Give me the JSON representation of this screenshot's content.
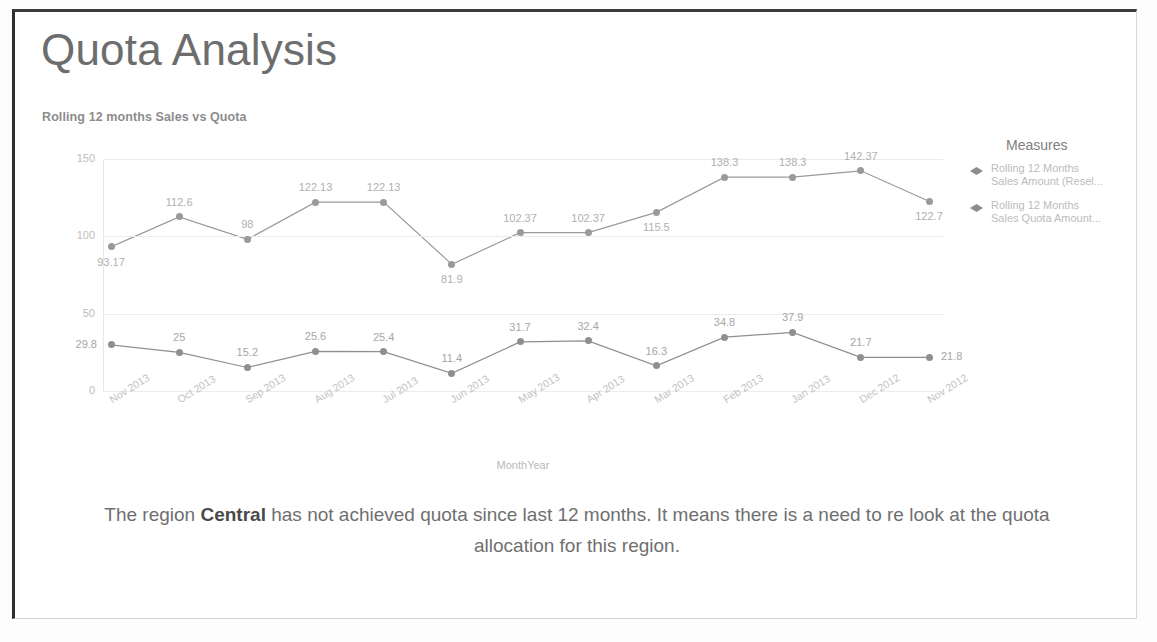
{
  "slide": {
    "title": "Quota Analysis",
    "caption_before": "The region ",
    "caption_bold": "Central",
    "caption_after": " has not achieved quota since last 12 months. It means there is a need to re look at the quota allocation for this region."
  },
  "legend": {
    "title": "Measures",
    "items": [
      {
        "label": "Rolling 12 Months\nSales Amount (Resel...",
        "marker": "diamond-marker-icon",
        "color": "#8d8d8d"
      },
      {
        "label": "Rolling 12 Months\nSales Quota Amount...",
        "marker": "diamond-marker-icon",
        "color": "#8d8d8d"
      }
    ]
  },
  "chart_data": {
    "type": "line",
    "title": "Rolling 12 months Sales vs Quota",
    "xlabel": "MonthYear",
    "ylabel": "",
    "ylim": [
      0,
      150
    ],
    "yticks": [
      "0",
      "50",
      "100",
      "150"
    ],
    "grid": true,
    "legend_position": "right",
    "categories": [
      "Nov 2013",
      "Oct 2013",
      "Sep 2013",
      "Aug 2013",
      "Jul 2013",
      "Jun 2013",
      "May 2013",
      "Apr 2013",
      "Mar 2013",
      "Feb 2013",
      "Jan 2013",
      "Dec 2012",
      "Nov 2012"
    ],
    "series": [
      {
        "name": "Rolling 12 Months Sales Amount (Resel...",
        "color": "#9a9a9a",
        "values": [
          93.17,
          112.6,
          98,
          122.13,
          122.13,
          81.9,
          102.37,
          102.37,
          115.5,
          138.3,
          138.3,
          142.37,
          122.7
        ],
        "labels": [
          "93.17",
          "112.6",
          "98",
          "122.13",
          "122.13",
          "81.9",
          "102.37",
          "102.37",
          "115.5",
          "138.3",
          "138.3",
          "142.37",
          "122.7"
        ],
        "label_positions": [
          "below",
          "above",
          "above",
          "above",
          "above",
          "below",
          "above",
          "above",
          "below",
          "above",
          "above",
          "above",
          "below"
        ]
      },
      {
        "name": "Rolling 12 Months Sales Quota Amount...",
        "color": "#8f8f8f",
        "values": [
          29.8,
          25,
          15.2,
          25.6,
          25.4,
          11.4,
          31.7,
          32.4,
          16.3,
          34.8,
          37.9,
          21.7,
          21.8
        ],
        "labels": [
          "29.8",
          "25",
          "15.2",
          "25.6",
          "25.4",
          "11.4",
          "31.7",
          "32.4",
          "16.3",
          "34.8",
          "37.9",
          "21.7",
          "21.8"
        ],
        "label_positions": [
          "left",
          "above",
          "above",
          "above",
          "above",
          "above",
          "above",
          "above",
          "above",
          "above",
          "above",
          "above",
          "right"
        ]
      }
    ]
  }
}
